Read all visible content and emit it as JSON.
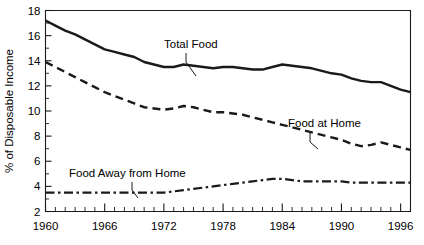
{
  "chart_data": {
    "type": "line",
    "title": "",
    "xlabel": "",
    "ylabel": "% of Disposable Income",
    "xlim": [
      1960,
      1997
    ],
    "ylim": [
      2,
      18
    ],
    "grid": false,
    "legend_position": "inline-annotations",
    "x_tick_labels": [
      "1960",
      "1966",
      "1972",
      "1978",
      "1984",
      "1990",
      "1996"
    ],
    "x_tick_values": [
      1960,
      1966,
      1972,
      1978,
      1984,
      1990,
      1996
    ],
    "x_minor_step": 1,
    "y_tick_labels": [
      "2",
      "4",
      "6",
      "8",
      "10",
      "12",
      "14",
      "16",
      "18"
    ],
    "y_tick_values": [
      2,
      4,
      6,
      8,
      10,
      12,
      14,
      16,
      18
    ],
    "y_minor_values": [
      3,
      5,
      7,
      9,
      11,
      13,
      15,
      17
    ],
    "x": [
      1960,
      1961,
      1962,
      1963,
      1964,
      1965,
      1966,
      1967,
      1968,
      1969,
      1970,
      1971,
      1972,
      1973,
      1974,
      1975,
      1976,
      1977,
      1978,
      1979,
      1980,
      1981,
      1982,
      1983,
      1984,
      1985,
      1986,
      1987,
      1988,
      1989,
      1990,
      1991,
      1992,
      1993,
      1994,
      1995,
      1996,
      1997
    ],
    "series": [
      {
        "name": "Total Food",
        "style": "solid",
        "color": "#1a1a1a",
        "label_text": "Total Food",
        "values": [
          17.2,
          16.8,
          16.4,
          16.1,
          15.7,
          15.3,
          14.9,
          14.7,
          14.5,
          14.3,
          13.9,
          13.7,
          13.5,
          13.5,
          13.7,
          13.6,
          13.5,
          13.4,
          13.5,
          13.5,
          13.4,
          13.3,
          13.3,
          13.5,
          13.7,
          13.6,
          13.5,
          13.4,
          13.2,
          13.0,
          12.9,
          12.6,
          12.4,
          12.3,
          12.3,
          12.0,
          11.7,
          11.5
        ]
      },
      {
        "name": "Food at Home",
        "style": "dashed",
        "color": "#1a1a1a",
        "label_text": "Food at Home",
        "values": [
          13.9,
          13.5,
          13.1,
          12.7,
          12.3,
          11.9,
          11.5,
          11.2,
          10.9,
          10.6,
          10.3,
          10.2,
          10.1,
          10.2,
          10.4,
          10.3,
          10.1,
          9.9,
          9.9,
          9.8,
          9.7,
          9.5,
          9.3,
          9.1,
          8.9,
          8.7,
          8.5,
          8.3,
          8.1,
          7.9,
          7.7,
          7.4,
          7.2,
          7.3,
          7.5,
          7.3,
          7.1,
          6.9
        ]
      },
      {
        "name": "Food Away from Home",
        "style": "dashdot",
        "color": "#1a1a1a",
        "label_text": "Food Away from Home",
        "values": [
          3.5,
          3.5,
          3.5,
          3.5,
          3.5,
          3.5,
          3.5,
          3.5,
          3.5,
          3.5,
          3.5,
          3.5,
          3.5,
          3.6,
          3.7,
          3.8,
          3.9,
          4.0,
          4.1,
          4.2,
          4.3,
          4.4,
          4.5,
          4.6,
          4.6,
          4.5,
          4.4,
          4.4,
          4.4,
          4.4,
          4.4,
          4.3,
          4.3,
          4.3,
          4.3,
          4.3,
          4.3,
          4.3
        ]
      }
    ],
    "annotations": [
      {
        "name": "total-food",
        "text": "Total Food",
        "text_x": 164,
        "text_y": 48,
        "leader": [
          [
            186,
            53
          ],
          [
            186,
            62
          ],
          [
            196,
            76
          ]
        ]
      },
      {
        "name": "food-at-home",
        "text": "Food at Home",
        "text_x": 288,
        "text_y": 127,
        "leader": [
          [
            310,
            132
          ],
          [
            310,
            142
          ],
          [
            318,
            149
          ]
        ]
      },
      {
        "name": "food-away-from-home",
        "text": "Food Away from Home",
        "text_x": 69,
        "text_y": 177,
        "leader": [
          [
            132,
            182
          ],
          [
            132,
            190
          ],
          [
            138,
            198
          ]
        ]
      }
    ]
  }
}
